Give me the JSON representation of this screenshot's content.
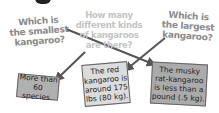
{
  "questions": [
    {
      "id": "smallest",
      "lines": [
        "Which is",
        "the smallest",
        "kangaroo?"
      ]
    },
    {
      "id": "how_many",
      "lines": [
        "How many",
        "different kinds",
        "of kangaroos",
        "are there?"
      ]
    },
    {
      "id": "largest",
      "lines": [
        "Which is",
        "the largest",
        "kangaroo?"
      ]
    }
  ],
  "answers": [
    {
      "id": "species",
      "lines": [
        "More than",
        "60 species."
      ]
    },
    {
      "id": "red",
      "lines": [
        "The red",
        "kangaroo is",
        "around 175",
        "lbs (80 kg)."
      ]
    },
    {
      "id": "musky",
      "lines": [
        "The musky",
        "rat-kangaroo",
        "is less than a",
        "pound (.5 kg)."
      ]
    }
  ],
  "matches": [
    {
      "from": "smallest",
      "to": "musky"
    },
    {
      "from": "how_many",
      "to": "species"
    },
    {
      "from": "largest",
      "to": "red"
    }
  ],
  "colors": {
    "question_text": "#8a8a8a",
    "question_text_light": "#c4c4c4",
    "arrow": "#555555",
    "box_dark": "#ababab",
    "box_light": "#dcdcdc"
  }
}
